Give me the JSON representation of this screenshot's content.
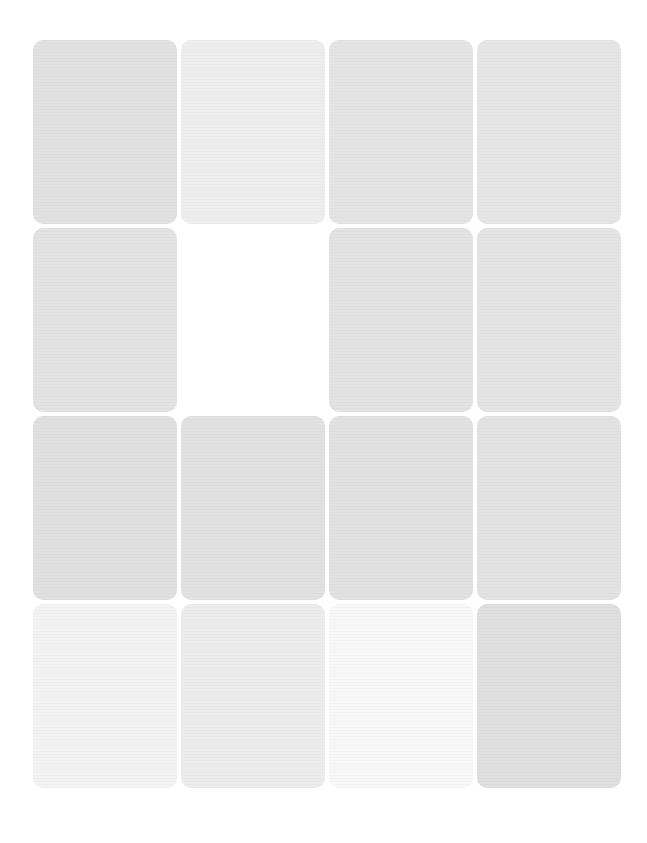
{
  "grid": {
    "rows": 4,
    "columns": 4,
    "tiles": [
      {
        "row": 1,
        "col": 1,
        "shade": "#e1e1e1"
      },
      {
        "row": 1,
        "col": 2,
        "shade": "#eeeeee"
      },
      {
        "row": 1,
        "col": 3,
        "shade": "#e4e4e4"
      },
      {
        "row": 1,
        "col": 4,
        "shade": "#e5e5e5"
      },
      {
        "row": 2,
        "col": 1,
        "shade": "#e3e3e3"
      },
      {
        "row": 2,
        "col": 2,
        "shade": "#ffffff"
      },
      {
        "row": 2,
        "col": 3,
        "shade": "#e3e3e3"
      },
      {
        "row": 2,
        "col": 4,
        "shade": "#e4e4e4"
      },
      {
        "row": 3,
        "col": 1,
        "shade": "#e0e0e0"
      },
      {
        "row": 3,
        "col": 2,
        "shade": "#e1e1e1"
      },
      {
        "row": 3,
        "col": 3,
        "shade": "#e1e1e1"
      },
      {
        "row": 3,
        "col": 4,
        "shade": "#e2e2e2"
      },
      {
        "row": 4,
        "col": 1,
        "shade": "#f3f3f3"
      },
      {
        "row": 4,
        "col": 2,
        "shade": "#ececec"
      },
      {
        "row": 4,
        "col": 3,
        "shade": "#f8f8f8"
      },
      {
        "row": 4,
        "col": 4,
        "shade": "#dfdfdf"
      }
    ]
  }
}
